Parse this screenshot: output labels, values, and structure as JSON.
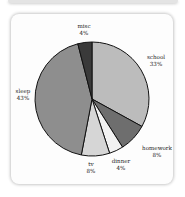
{
  "chart_data": {
    "type": "pie",
    "title": "",
    "slices": [
      {
        "label": "school",
        "value": 33,
        "display": "33%",
        "color": "#bcbcbc"
      },
      {
        "label": "homework",
        "value": 8,
        "display": "8%",
        "color": "#6e6e6e"
      },
      {
        "label": "dinner",
        "value": 4,
        "display": "4%",
        "color": "#f2f2f2"
      },
      {
        "label": "tv",
        "value": 8,
        "display": "8%",
        "color": "#d6d6d6"
      },
      {
        "label": "sleep",
        "value": 43,
        "display": "43%",
        "color": "#8e8e8e"
      },
      {
        "label": "misc",
        "value": 4,
        "display": "4%",
        "color": "#3a3a3a"
      }
    ],
    "start_angle_deg": 0,
    "direction": "clockwise",
    "legend": "none",
    "labels_outside": true
  }
}
